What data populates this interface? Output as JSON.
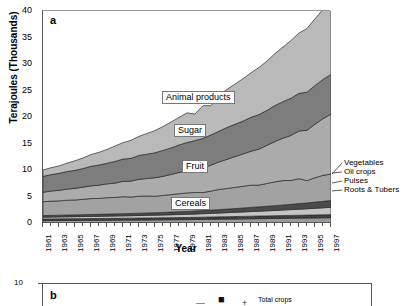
{
  "figure": {
    "panel_a_label": "a",
    "panel_b_label": "b"
  },
  "axes": {
    "ylabel": "Terajoules (Thousands)",
    "xlabel": "Year",
    "yticks": [
      "0",
      "5",
      "10",
      "15",
      "20",
      "25",
      "30",
      "35",
      "40"
    ],
    "xticks": [
      "1961",
      "1963",
      "1965",
      "1967",
      "1969",
      "1971",
      "1973",
      "1975",
      "1977",
      "1979",
      "1981",
      "1983",
      "1985",
      "1987",
      "1989",
      "1991",
      "1993",
      "1995",
      "1997"
    ]
  },
  "callouts": {
    "animal_products": "Animal products",
    "sugar": "Sugar",
    "fruit": "Fruit",
    "cereals": "Cereals"
  },
  "side_labels": {
    "vegetables": "Vegetables",
    "oil_crops": "Oil crops",
    "pulses": "Pulses",
    "roots_tubers": "Roots & Tubers"
  },
  "panel_b": {
    "ytick_top": "10",
    "legend_label": "Total crops"
  },
  "colors": {
    "animal_products": "#b9b9b9",
    "sugar": "#7d7d7d",
    "fruit": "#ababab",
    "vegetables": "#4a4a4a",
    "oil_crops": "#c4c4c4",
    "pulses": "#3f3f3f",
    "roots_tubers": "#9a9a9a",
    "cereals": "#a2a2a2",
    "axis": "#555555",
    "background": "#ffffff"
  },
  "chart_data": {
    "type": "area",
    "title": "",
    "xlabel": "Year",
    "ylabel": "Terajoules (Thousands)",
    "xlim": [
      1961,
      1997
    ],
    "ylim": [
      0,
      40
    ],
    "grid": false,
    "stacked": true,
    "legend_position": "in-plot callouts and right-side leader labels",
    "x": [
      1961,
      1962,
      1963,
      1964,
      1965,
      1966,
      1967,
      1968,
      1969,
      1970,
      1971,
      1972,
      1973,
      1974,
      1975,
      1976,
      1977,
      1978,
      1979,
      1980,
      1981,
      1982,
      1983,
      1984,
      1985,
      1986,
      1987,
      1988,
      1989,
      1990,
      1991,
      1992,
      1993,
      1994,
      1995,
      1996,
      1997
    ],
    "series": [
      {
        "name": "Roots & Tubers",
        "values": [
          0.45,
          0.46,
          0.47,
          0.48,
          0.49,
          0.5,
          0.51,
          0.52,
          0.53,
          0.54,
          0.55,
          0.56,
          0.57,
          0.58,
          0.59,
          0.6,
          0.62,
          0.63,
          0.64,
          0.66,
          0.68,
          0.7,
          0.72,
          0.74,
          0.76,
          0.78,
          0.8,
          0.82,
          0.84,
          0.86,
          0.88,
          0.9,
          0.92,
          0.94,
          0.96,
          0.98,
          1.0
        ]
      },
      {
        "name": "Pulses",
        "values": [
          0.3,
          0.3,
          0.31,
          0.31,
          0.32,
          0.32,
          0.33,
          0.33,
          0.34,
          0.34,
          0.35,
          0.35,
          0.36,
          0.36,
          0.37,
          0.38,
          0.38,
          0.39,
          0.4,
          0.41,
          0.42,
          0.43,
          0.44,
          0.45,
          0.46,
          0.47,
          0.48,
          0.49,
          0.5,
          0.51,
          0.52,
          0.53,
          0.54,
          0.55,
          0.56,
          0.57,
          0.58
        ]
      },
      {
        "name": "Oil crops",
        "values": [
          0.35,
          0.36,
          0.37,
          0.38,
          0.39,
          0.4,
          0.41,
          0.42,
          0.43,
          0.45,
          0.46,
          0.47,
          0.49,
          0.5,
          0.52,
          0.54,
          0.56,
          0.58,
          0.6,
          0.63,
          0.66,
          0.69,
          0.72,
          0.76,
          0.8,
          0.84,
          0.88,
          0.92,
          0.96,
          1.0,
          1.05,
          1.1,
          1.15,
          1.2,
          1.26,
          1.32,
          1.38
        ]
      },
      {
        "name": "Vegetables",
        "values": [
          0.3,
          0.31,
          0.32,
          0.33,
          0.34,
          0.35,
          0.36,
          0.37,
          0.38,
          0.39,
          0.4,
          0.42,
          0.43,
          0.45,
          0.46,
          0.48,
          0.5,
          0.52,
          0.54,
          0.56,
          0.58,
          0.61,
          0.64,
          0.67,
          0.7,
          0.74,
          0.78,
          0.82,
          0.86,
          0.9,
          0.95,
          1.0,
          1.05,
          1.1,
          1.16,
          1.22,
          1.28
        ]
      },
      {
        "name": "Cereals",
        "values": [
          2.6,
          2.7,
          2.7,
          2.8,
          2.8,
          2.9,
          3.0,
          3.0,
          3.1,
          3.1,
          3.2,
          3.1,
          3.2,
          3.2,
          3.1,
          3.2,
          3.3,
          3.4,
          3.5,
          3.5,
          3.4,
          3.6,
          3.8,
          3.9,
          4.0,
          4.1,
          4.2,
          4.1,
          4.3,
          4.5,
          4.6,
          4.5,
          4.7,
          4.2,
          4.6,
          4.9,
          5.0
        ]
      },
      {
        "name": "Fruit",
        "values": [
          1.8,
          1.9,
          2.0,
          2.1,
          2.2,
          2.3,
          2.4,
          2.5,
          2.6,
          2.7,
          2.9,
          3.0,
          3.2,
          3.3,
          3.5,
          3.6,
          3.8,
          4.0,
          4.2,
          4.4,
          4.6,
          4.9,
          5.2,
          5.5,
          5.8,
          6.1,
          6.4,
          6.8,
          7.2,
          7.6,
          8.0,
          8.5,
          9.0,
          9.5,
          10.1,
          10.7,
          11.3
        ]
      },
      {
        "name": "Sugar",
        "values": [
          3.0,
          3.1,
          3.2,
          3.3,
          3.4,
          3.5,
          3.7,
          3.8,
          3.9,
          4.1,
          4.2,
          4.3,
          4.5,
          4.6,
          4.7,
          4.9,
          5.0,
          5.2,
          5.3,
          5.4,
          5.6,
          5.7,
          5.8,
          6.0,
          6.1,
          6.2,
          6.4,
          6.5,
          6.6,
          6.8,
          6.9,
          7.0,
          7.1,
          7.2,
          7.3,
          7.4,
          7.5
        ]
      },
      {
        "name": "Animal products",
        "values": [
          1.2,
          1.3,
          1.4,
          1.6,
          1.8,
          2.0,
          2.2,
          2.4,
          2.6,
          2.9,
          3.1,
          3.4,
          3.6,
          3.9,
          4.2,
          4.5,
          4.9,
          5.2,
          5.6,
          5.0,
          6.2,
          5.5,
          6.8,
          7.2,
          7.6,
          8.0,
          8.4,
          8.9,
          9.3,
          9.8,
          10.3,
          10.9,
          11.4,
          12.0,
          12.6,
          13.2,
          13.9
        ]
      }
    ],
    "totals_note": "Stacked totals rise from about 10 in 1961 to about 38 in 1997"
  }
}
